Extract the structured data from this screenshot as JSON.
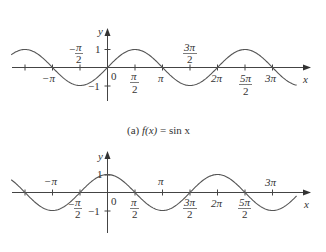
{
  "chart_data": [
    {
      "type": "line",
      "title": "(a) f(x) = sin x",
      "caption_prefix": "(a)",
      "caption_func": "f(x)",
      "caption_eq": "= sin x",
      "xlabel": "x",
      "ylabel": "y",
      "function": "sin",
      "xlim": [
        -5.5,
        10.8
      ],
      "ylim": [
        -1,
        1
      ],
      "grid": false,
      "x_ticks": [
        {
          "value": -4.712,
          "label": ""
        },
        {
          "value": -3.1416,
          "label": "−π",
          "pos": "below"
        },
        {
          "value": -1.5708,
          "label": "−π/2",
          "pos": "above"
        },
        {
          "value": 0,
          "label": "0",
          "pos": "below"
        },
        {
          "value": 1.5708,
          "label": "π/2",
          "pos": "below"
        },
        {
          "value": 3.1416,
          "label": "π",
          "pos": "below"
        },
        {
          "value": 4.7124,
          "label": "3π/2",
          "pos": "above"
        },
        {
          "value": 6.2832,
          "label": "2π",
          "pos": "below"
        },
        {
          "value": 7.854,
          "label": "5π/2",
          "pos": "below"
        },
        {
          "value": 9.4248,
          "label": "3π",
          "pos": "below"
        }
      ],
      "y_ticks": [
        {
          "value": 1,
          "label": "1"
        },
        {
          "value": -1,
          "label": "−1"
        }
      ],
      "x": [
        -5.5,
        -4.712,
        -3.1416,
        -1.5708,
        0,
        1.5708,
        3.1416,
        4.7124,
        6.2832,
        7.854,
        9.4248,
        10.8
      ],
      "values": [
        0.71,
        1,
        0,
        -1,
        0,
        1,
        0,
        -1,
        0,
        1,
        0,
        -0.98
      ]
    },
    {
      "type": "line",
      "title": "(b) g(x) = cos x",
      "xlabel": "x",
      "ylabel": "y",
      "function": "cos",
      "xlim": [
        -5.5,
        10.8
      ],
      "ylim": [
        -1,
        1
      ],
      "grid": false,
      "x_ticks": [
        {
          "value": -4.712,
          "label": ""
        },
        {
          "value": -3.1416,
          "label": "−π",
          "pos": "above"
        },
        {
          "value": -1.5708,
          "label": "−π/2",
          "pos": "below"
        },
        {
          "value": 0,
          "label": "0",
          "pos": "below"
        },
        {
          "value": 1.5708,
          "label": "π/2",
          "pos": "below"
        },
        {
          "value": 3.1416,
          "label": "π",
          "pos": "above"
        },
        {
          "value": 4.7124,
          "label": "3π/2",
          "pos": "below"
        },
        {
          "value": 6.2832,
          "label": "2π",
          "pos": "below"
        },
        {
          "value": 7.854,
          "label": "5π/2",
          "pos": "below"
        },
        {
          "value": 9.4248,
          "label": "3π",
          "pos": "above"
        }
      ],
      "y_ticks": [
        {
          "value": 1,
          "label": "1"
        },
        {
          "value": -1,
          "label": "−1"
        }
      ],
      "x": [
        -5.5,
        -4.712,
        -3.1416,
        -1.5708,
        0,
        1.5708,
        3.1416,
        4.7124,
        6.2832,
        7.854,
        9.4248,
        10.8
      ],
      "values": [
        0.71,
        0,
        -1,
        0,
        1,
        0,
        -1,
        0,
        1,
        0,
        -1,
        -0.2
      ]
    }
  ],
  "labels": {
    "top": {
      "y": "y",
      "x": "x",
      "one": "1",
      "neg_one": "−1",
      "zero": "0",
      "neg_pi": "−π",
      "neg_pi_half_num": "π",
      "neg_pi_half_den": "2",
      "pi_half_num": "π",
      "pi_half_den": "2",
      "pi": "π",
      "three_pi_half_num": "3π",
      "three_pi_half_den": "2",
      "two_pi": "2π",
      "five_pi_half_num": "5π",
      "five_pi_half_den": "2",
      "three_pi": "3π"
    },
    "bottom": {
      "y": "y",
      "x": "x",
      "one": "1",
      "neg_one": "−1",
      "zero": "0",
      "neg_pi": "−π",
      "neg_pi_half_num": "π",
      "neg_pi_half_den": "2",
      "pi_half_num": "π",
      "pi_half_den": "2",
      "pi": "π",
      "three_pi_half_num": "3π",
      "three_pi_half_den": "2",
      "two_pi": "2π",
      "five_pi_half_num": "5π",
      "five_pi_half_den": "2",
      "three_pi": "3π"
    },
    "caption_a": {
      "prefix": "(a) ",
      "func": "f(x)",
      "eq": " = sin x"
    }
  }
}
